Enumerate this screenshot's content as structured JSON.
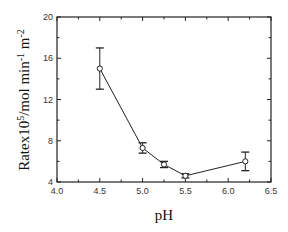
{
  "chart_data": {
    "type": "line",
    "title": "",
    "xlabel": "pH",
    "ylabel": "Ratex10^5/mol min^-1 m^-2",
    "xlim": [
      4.0,
      6.5
    ],
    "ylim": [
      4,
      20
    ],
    "x_ticks": [
      "4.0",
      "4.5",
      "5.0",
      "5.5",
      "6.0",
      "6.5"
    ],
    "y_ticks": [
      "4",
      "8",
      "12",
      "16",
      "20"
    ],
    "grid": false,
    "legend": null,
    "series": [
      {
        "name": "Rate",
        "marker": "open-circle",
        "x": [
          4.5,
          5.0,
          5.25,
          5.5,
          6.2
        ],
        "values": [
          15.0,
          7.3,
          5.7,
          4.6,
          6.0
        ],
        "error": [
          2.0,
          0.5,
          0.3,
          0.2,
          0.9
        ]
      }
    ]
  }
}
